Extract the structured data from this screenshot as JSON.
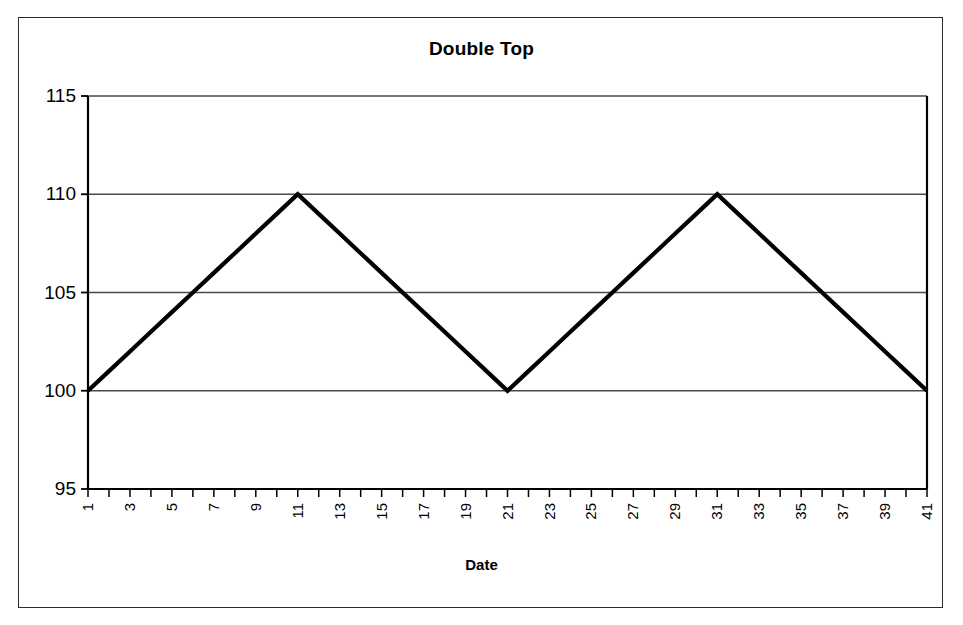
{
  "figure": {
    "title": "Double Top",
    "background_color": "#ffffff",
    "border_color": "#2b2b2b",
    "line_color": "#000000",
    "grid_color": "#4a4a4a"
  },
  "chart_data": {
    "type": "line",
    "title": "Double Top",
    "xlabel": "Date",
    "ylabel": "",
    "xlim": [
      1,
      41
    ],
    "ylim": [
      95,
      115
    ],
    "grid": true,
    "legend": false,
    "yticks": [
      95,
      100,
      105,
      110,
      115
    ],
    "xticks": [
      1,
      2,
      3,
      4,
      5,
      6,
      7,
      8,
      9,
      10,
      11,
      12,
      13,
      14,
      15,
      16,
      17,
      18,
      19,
      20,
      21,
      22,
      23,
      24,
      25,
      26,
      27,
      28,
      29,
      30,
      31,
      32,
      33,
      34,
      35,
      36,
      37,
      38,
      39,
      40,
      41
    ],
    "xtick_labels": [
      "1",
      "",
      "3",
      "",
      "5",
      "",
      "7",
      "",
      "9",
      "",
      "11",
      "",
      "13",
      "",
      "15",
      "",
      "17",
      "",
      "19",
      "",
      "21",
      "",
      "23",
      "",
      "25",
      "",
      "27",
      "",
      "29",
      "",
      "31",
      "",
      "33",
      "",
      "35",
      "",
      "37",
      "",
      "39",
      "",
      "41"
    ],
    "xtick_rotation": 90,
    "series": [
      {
        "name": "Price",
        "x": [
          1,
          2,
          3,
          4,
          5,
          6,
          7,
          8,
          9,
          10,
          11,
          12,
          13,
          14,
          15,
          16,
          17,
          18,
          19,
          20,
          21,
          22,
          23,
          24,
          25,
          26,
          27,
          28,
          29,
          30,
          31,
          32,
          33,
          34,
          35,
          36,
          37,
          38,
          39,
          40,
          41
        ],
        "values": [
          100,
          101,
          102,
          103,
          104,
          105,
          106,
          107,
          108,
          109,
          110,
          109,
          108,
          107,
          106,
          105,
          104,
          103,
          102,
          101,
          100,
          101,
          102,
          103,
          104,
          105,
          106,
          107,
          108,
          109,
          110,
          109,
          108,
          107,
          106,
          105,
          104,
          103,
          102,
          101,
          100
        ]
      }
    ],
    "annotations": [
      {
        "label": "first top",
        "x": 11,
        "y": 110
      },
      {
        "label": "trough",
        "x": 21,
        "y": 100
      },
      {
        "label": "second top",
        "x": 31,
        "y": 110
      }
    ]
  }
}
